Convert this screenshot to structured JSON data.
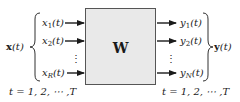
{
  "diagram": {
    "block": {
      "label": "W",
      "fill": "#e9e9e9",
      "border": "#555555"
    },
    "input": {
      "vector_label": "x(t)",
      "vector_name": "x",
      "arg": "(t)",
      "items": [
        {
          "base": "x",
          "sub": "1",
          "arg": "(t)"
        },
        {
          "base": "x",
          "sub": "2",
          "arg": "(t)"
        },
        {
          "base": "x",
          "sub": "R",
          "arg": "(t)"
        }
      ],
      "ellipsis": "⋮",
      "time_range": "t = 1, 2, ⋯ ,T"
    },
    "output": {
      "vector_label": "y(t)",
      "vector_name": "y",
      "arg": "(t)",
      "items": [
        {
          "base": "y",
          "sub": "1",
          "arg": "(t)"
        },
        {
          "base": "y",
          "sub": "2",
          "arg": "(t)"
        },
        {
          "base": "y",
          "sub": "N",
          "arg": "(t)"
        }
      ],
      "ellipsis": "⋮",
      "time_range": "t = 1, 2, ⋯ ,T"
    }
  }
}
